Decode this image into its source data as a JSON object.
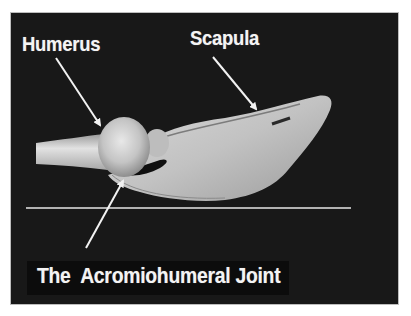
{
  "image": {
    "subject": "Lateral 3D rendering of shoulder bones showing humerus and scapula",
    "background_color": "#181818",
    "bone_color": "#cfcfcf",
    "line_color": "#e6e6e6"
  },
  "labels": {
    "humerus": "Humerus",
    "scapula": "Scapula",
    "joint": "The  Acromiohumeral Joint"
  },
  "annotations": [
    {
      "label": "Humerus",
      "arrow_from": [
        56,
        58
      ],
      "arrow_to": [
        102,
        128
      ]
    },
    {
      "label": "Scapula",
      "arrow_from": [
        213,
        57
      ],
      "arrow_to": [
        258,
        112
      ]
    },
    {
      "label": "The  Acromiohumeral Joint",
      "arrow_from": [
        86,
        248
      ],
      "arrow_to": [
        125,
        178
      ]
    }
  ],
  "reference_line": {
    "x1": 26,
    "x2": 351,
    "y": 208
  }
}
